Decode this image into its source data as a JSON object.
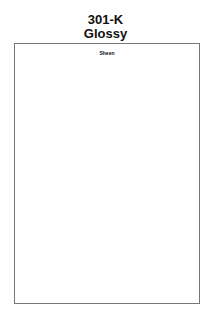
{
  "header": {
    "code": "301-K",
    "finish": "Glossy"
  },
  "panel": {
    "label": "Sheen"
  }
}
